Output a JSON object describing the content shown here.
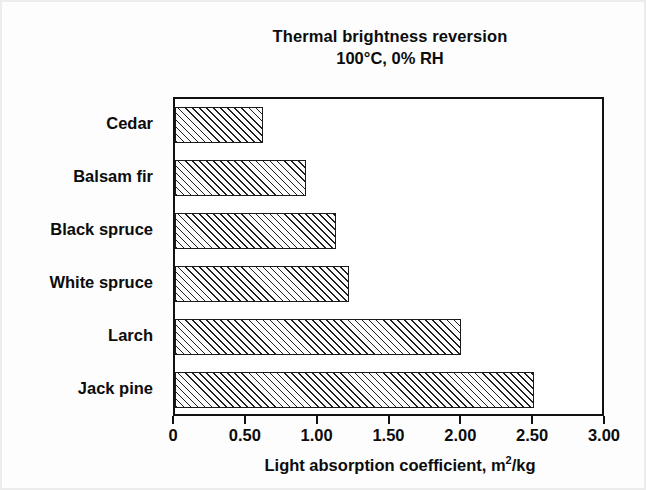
{
  "chart_data": {
    "type": "bar",
    "orientation": "horizontal",
    "title": "Thermal brightness reversion",
    "subtitle": "100°C, 0% RH",
    "xlabel": "Light absorption coefficient, m2/kg",
    "xlabel_base": "Light absorption coefficient, m",
    "xlabel_sup": "2",
    "xlabel_tail": "/kg",
    "ylabel": "",
    "categories": [
      "Cedar",
      "Balsam fir",
      "Black spruce",
      "White spruce",
      "Larch",
      "Jack pine"
    ],
    "values": [
      0.61,
      0.91,
      1.12,
      1.21,
      1.99,
      2.5
    ],
    "xlim": [
      0,
      3.0
    ],
    "xticks": [
      0,
      0.5,
      1.0,
      1.5,
      2.0,
      2.5,
      3.0
    ],
    "xtick_labels": [
      "0",
      "0.50",
      "1.00",
      "1.50",
      "2.00",
      "2.50",
      "3.00"
    ],
    "grid": false,
    "legend": false,
    "bar_fill": "hatched-diagonal",
    "bar_edge_color": "#1a1a1a",
    "axis_color": "#111111",
    "background": "#ffffff"
  },
  "figure": {
    "border_color": "#ececed"
  }
}
